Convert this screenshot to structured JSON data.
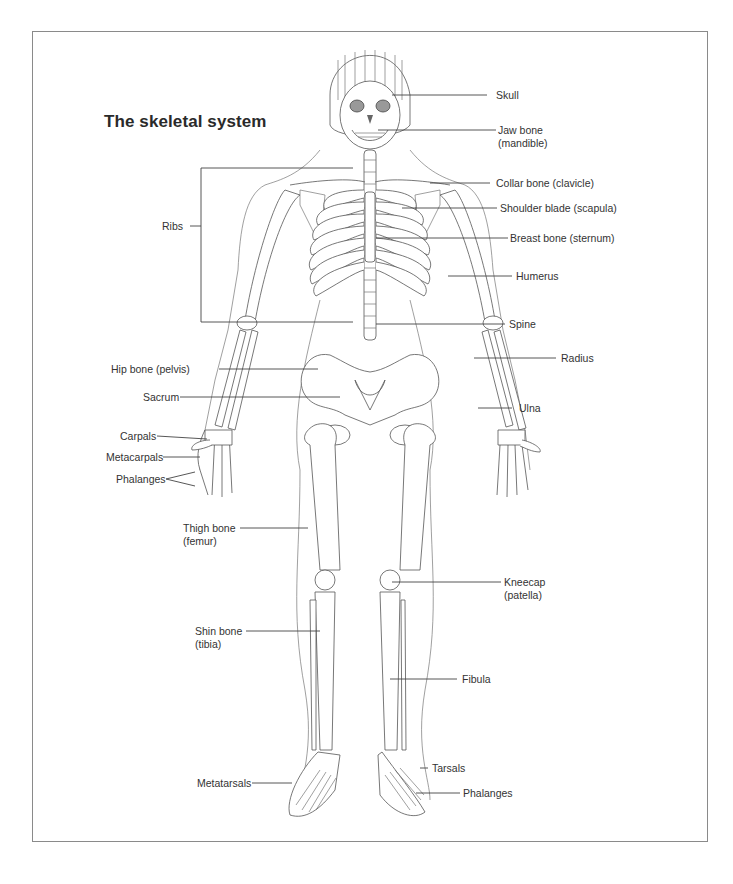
{
  "figure": {
    "title": "The skeletal system"
  },
  "labels": {
    "right": [
      {
        "id": "skull",
        "text": "Skull"
      },
      {
        "id": "jaw-bone",
        "line1": "Jaw bone",
        "line2": "(mandible)"
      },
      {
        "id": "collar-bone",
        "text": "Collar bone (clavicle)"
      },
      {
        "id": "shoulder-blade",
        "text": "Shoulder blade (scapula)"
      },
      {
        "id": "breast-bone",
        "text": "Breast bone (sternum)"
      },
      {
        "id": "humerus",
        "text": "Humerus"
      },
      {
        "id": "spine",
        "text": "Spine"
      },
      {
        "id": "radius",
        "text": "Radius"
      },
      {
        "id": "ulna",
        "text": "Ulna"
      },
      {
        "id": "kneecap",
        "line1": "Kneecap",
        "line2": "(patella)"
      },
      {
        "id": "fibula",
        "text": "Fibula"
      },
      {
        "id": "tarsals",
        "text": "Tarsals"
      },
      {
        "id": "phalanges-foot",
        "text": "Phalanges"
      }
    ],
    "left": [
      {
        "id": "ribs",
        "text": "Ribs"
      },
      {
        "id": "hip-bone",
        "text": "Hip bone (pelvis)"
      },
      {
        "id": "sacrum",
        "text": "Sacrum"
      },
      {
        "id": "carpals",
        "text": "Carpals"
      },
      {
        "id": "metacarpals",
        "text": "Metacarpals"
      },
      {
        "id": "phalanges-hand",
        "text": "Phalanges"
      },
      {
        "id": "thigh-bone",
        "line1": "Thigh bone",
        "line2": "(femur)"
      },
      {
        "id": "shin-bone",
        "line1": "Shin bone",
        "line2": "(tibia)"
      },
      {
        "id": "metatarsals",
        "text": "Metatarsals"
      }
    ]
  },
  "colors": {
    "line": "#444444",
    "text": "#2a2a2a",
    "frame": "#8a8a8a"
  }
}
